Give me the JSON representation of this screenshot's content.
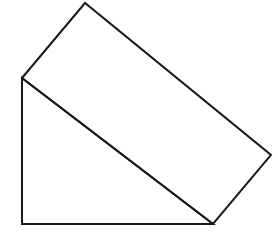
{
  "figure": {
    "background_color": "#ffffff",
    "stroke_color": "#1a1a1a",
    "fill_color": "#ffffff",
    "stroke_width": 2,
    "canvas": {
      "width": 278,
      "height": 237
    },
    "vertices": {
      "left": {
        "x": 22,
        "y": 78
      },
      "top": {
        "x": 85,
        "y": 3
      },
      "right": {
        "x": 271,
        "y": 155
      },
      "bottom_right": {
        "x": 213,
        "y": 224
      },
      "bottom_left": {
        "x": 22,
        "y": 224
      }
    },
    "shapes": [
      {
        "name": "tilted-rectangle",
        "points": "22,78 85,3 271,155 213,224"
      },
      {
        "name": "right-triangle",
        "points": "22,78 213,224 22,224"
      }
    ],
    "edges": [
      {
        "name": "upper-left-edge",
        "from": "left",
        "to": "top"
      },
      {
        "name": "upper-right-edge",
        "from": "top",
        "to": "right"
      },
      {
        "name": "lower-right-edge",
        "from": "right",
        "to": "bottom_right"
      },
      {
        "name": "shared-diagonal-edge",
        "from": "left",
        "to": "bottom_right"
      },
      {
        "name": "left-vertical-edge",
        "from": "left",
        "to": "bottom_left"
      },
      {
        "name": "bottom-horizontal-edge",
        "from": "bottom_left",
        "to": "bottom_right"
      }
    ]
  }
}
